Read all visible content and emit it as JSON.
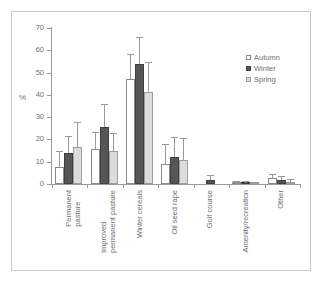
{
  "chart_data": {
    "type": "bar",
    "title": "",
    "subtitle": "",
    "xlabel": "",
    "ylabel": "%",
    "ylim": [
      0,
      70
    ],
    "ytick_values": [
      0,
      10,
      20,
      30,
      40,
      50,
      60,
      70
    ],
    "ytick_labels": [
      "0",
      "10",
      "20",
      "30",
      "40",
      "50",
      "60",
      "70"
    ],
    "grid": false,
    "legend_position": "upper-right",
    "categories": [
      "Permanent pasture",
      "Improved permanent pasture",
      "Winter cereals",
      "Oil seed rape",
      "Golf course",
      "Amenity/recreation",
      "Other"
    ],
    "category_label_lines": [
      [
        "Permanent",
        "pasture"
      ],
      [
        "Improved",
        "permanent pasture"
      ],
      [
        "Winter cereals"
      ],
      [
        "Oil seed rape"
      ],
      [
        "Golf course"
      ],
      [
        "Amenity/recreation"
      ],
      [
        "Other"
      ]
    ],
    "series": [
      {
        "name": "Autumn",
        "color": "#ffffff",
        "values": [
          7.5,
          15.5,
          47.0,
          9.0,
          0.0,
          0.4,
          2.5
        ],
        "errors": [
          7.0,
          7.5,
          11.0,
          8.5,
          0.0,
          0.3,
          1.5
        ]
      },
      {
        "name": "Winter",
        "color": "#565656",
        "values": [
          14.0,
          25.5,
          53.8,
          12.0,
          1.8,
          0.5,
          2.0
        ],
        "errors": [
          7.0,
          10.0,
          11.5,
          8.5,
          2.0,
          0.4,
          1.0
        ]
      },
      {
        "name": "Spring",
        "color": "#dcdcdc",
        "values": [
          16.5,
          15.0,
          41.5,
          11.0,
          0.0,
          0.3,
          1.0
        ]
      }
    ],
    "spring_errors": [
      11.0,
      7.5,
      13.0,
      9.0,
      0.0,
      0.3,
      0.7
    ]
  },
  "legend": {
    "items": [
      {
        "label": "Autumn",
        "swatch": "autumn"
      },
      {
        "label": "Winter",
        "swatch": "winter"
      },
      {
        "label": "Spring",
        "swatch": "spring"
      }
    ]
  }
}
